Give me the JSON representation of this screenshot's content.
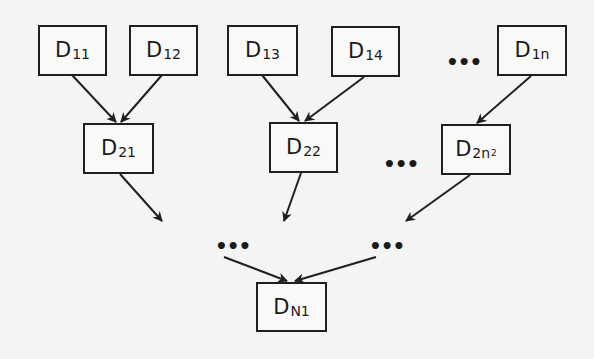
{
  "diagram": {
    "type": "hierarchical-tree",
    "colors": {
      "background": "#f4f4f2",
      "stroke": "#1f1f1f",
      "text": "#1a1a1a"
    },
    "level1": [
      {
        "id": "D11",
        "main": "D",
        "sub": "11"
      },
      {
        "id": "D12",
        "main": "D",
        "sub": "12"
      },
      {
        "id": "D13",
        "main": "D",
        "sub": "13"
      },
      {
        "id": "D14",
        "main": "D",
        "sub": "14"
      },
      {
        "id": "D1n",
        "main": "D",
        "sub": "1n"
      }
    ],
    "level2": [
      {
        "id": "D21",
        "main": "D",
        "sub": "21"
      },
      {
        "id": "D22",
        "main": "D",
        "sub": "22"
      },
      {
        "id": "D2n2",
        "main": "D",
        "sub": "2n",
        "sub2": "2"
      }
    ],
    "root": {
      "id": "DN1",
      "main": "D",
      "sub": "N1"
    },
    "ellipsis": "•••",
    "edges": [
      [
        "D11",
        "D21"
      ],
      [
        "D12",
        "D21"
      ],
      [
        "D13",
        "D22"
      ],
      [
        "D14",
        "D22"
      ],
      [
        "D1n",
        "D2n2"
      ],
      [
        "D21",
        "..."
      ],
      [
        "D22",
        "..."
      ],
      [
        "D2n2",
        "..."
      ],
      [
        "...",
        "DN1"
      ],
      [
        "...",
        "DN1"
      ]
    ]
  }
}
